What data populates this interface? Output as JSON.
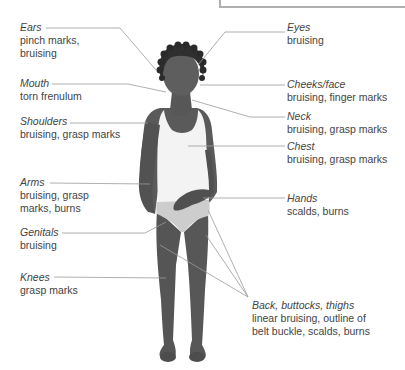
{
  "diagram": {
    "colors": {
      "skin": "#5a5a5a",
      "skin_shadow": "#474747",
      "hair": "#2e2e2e",
      "singlet": "#f4f4f4",
      "underwear": "#cfcfcf",
      "leader_line": "#9a9a9a",
      "frame": "#b0b0b0",
      "text": "#444444"
    },
    "labels_left": [
      {
        "id": "ears",
        "part": "Ears",
        "finding_lines": [
          "pinch marks,",
          "bruising"
        ]
      },
      {
        "id": "mouth",
        "part": "Mouth",
        "finding_lines": [
          "torn frenulum"
        ]
      },
      {
        "id": "shoulders",
        "part": "Shoulders",
        "finding_lines": [
          "bruising, grasp marks"
        ]
      },
      {
        "id": "arms",
        "part": "Arms",
        "finding_lines": [
          "bruising, grasp",
          "marks, burns"
        ]
      },
      {
        "id": "genitals",
        "part": "Genitals",
        "finding_lines": [
          "bruising"
        ]
      },
      {
        "id": "knees",
        "part": "Knees",
        "finding_lines": [
          "grasp marks"
        ]
      }
    ],
    "labels_right": [
      {
        "id": "eyes",
        "part": "Eyes",
        "finding_lines": [
          "bruising"
        ]
      },
      {
        "id": "cheeks-face",
        "part": "Cheeks/face",
        "finding_lines": [
          "bruising, finger marks"
        ]
      },
      {
        "id": "neck",
        "part": "Neck",
        "finding_lines": [
          "bruising, grasp marks"
        ]
      },
      {
        "id": "chest",
        "part": "Chest",
        "finding_lines": [
          "bruising, grasp marks"
        ]
      },
      {
        "id": "hands",
        "part": "Hands",
        "finding_lines": [
          "scalds, burns"
        ]
      },
      {
        "id": "back-buttocks-thighs",
        "part": "Back, buttocks, thighs",
        "finding_lines": [
          "linear bruising, outline of",
          "belt buckle, scalds, burns"
        ]
      }
    ]
  }
}
